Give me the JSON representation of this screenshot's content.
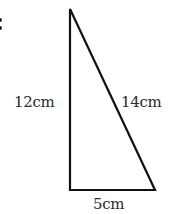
{
  "diagram": {
    "shape": "right-triangle",
    "stroke_color": "#111111",
    "vertices": {
      "top": [
        70,
        9
      ],
      "bottom_left": [
        70,
        190
      ],
      "bottom_right": [
        155,
        190
      ]
    },
    "labels": {
      "left_side": "12cm",
      "hypotenuse": "14cm",
      "bottom_side": "5cm"
    },
    "left_margin_glyph": ":"
  }
}
